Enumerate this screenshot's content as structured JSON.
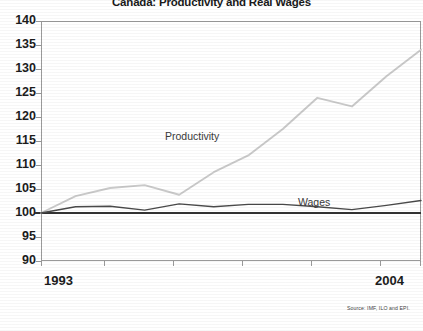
{
  "chart_data": {
    "type": "line",
    "title": "Canada: Productivity and Real Wages",
    "xlabel": "",
    "ylabel": "",
    "ylim": [
      90,
      140
    ],
    "ytick_step": 5,
    "yticks": [
      90,
      95,
      100,
      105,
      110,
      115,
      120,
      125,
      130,
      135,
      140
    ],
    "xlim": [
      1993,
      2004
    ],
    "xticks": [
      1993,
      2004
    ],
    "xtick_labels": [
      "1993",
      "2004"
    ],
    "grid": false,
    "legend_position": "inline-annotations",
    "reference_line": 100,
    "x": [
      1993,
      1994,
      1995,
      1996,
      1997,
      1998,
      1999,
      2000,
      2001,
      2002,
      2003,
      2004
    ],
    "series": [
      {
        "name": "Productivity",
        "color": "#c9c9c9",
        "values": [
          100.0,
          103.5,
          105.2,
          105.8,
          103.8,
          108.5,
          112.0,
          117.5,
          124.0,
          122.2,
          128.5,
          134.0
        ]
      },
      {
        "name": "Wages",
        "color": "#4a4a4a",
        "values": [
          100.0,
          101.3,
          101.4,
          100.6,
          101.9,
          101.3,
          101.8,
          101.8,
          101.3,
          100.7,
          101.6,
          102.6
        ]
      }
    ],
    "annotations": [
      {
        "text": "Productivity",
        "x": 1996.5,
        "y": 113.5
      },
      {
        "text": "Wages",
        "x": 2001.2,
        "y": 104.0
      }
    ],
    "source_note": "Source: IMF, ILO and EPI."
  },
  "axis": {
    "y_labels": [
      "140",
      "135",
      "130",
      "125",
      "120",
      "115",
      "110",
      "105",
      "100",
      "95",
      "90"
    ],
    "x_label_start": "1993",
    "x_label_end": "2004"
  },
  "labels": {
    "productivity": "Productivity",
    "wages": "Wages"
  },
  "footer": {
    "source": "Source: IMF, ILO and EPI."
  }
}
